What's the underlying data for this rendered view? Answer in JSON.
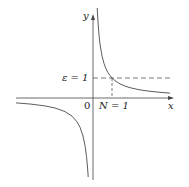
{
  "diagram": {
    "axes": {
      "x_label": "x",
      "y_label": "y",
      "origin_label": "0"
    },
    "annotations": {
      "epsilon_label": "ε = 1",
      "n_label": "N = 1"
    },
    "colors": {
      "line": "#333333",
      "background": "#ffffff"
    }
  }
}
